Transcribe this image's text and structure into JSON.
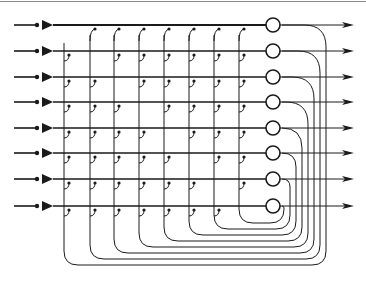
{
  "diagram": {
    "num_neurons": 8,
    "row_y": [
      25,
      51,
      77,
      102,
      128,
      153,
      179,
      206
    ],
    "column_x": [
      64,
      90,
      114,
      139,
      164,
      189,
      214,
      239
    ],
    "neuron_x": 273,
    "neuron_radius": 7,
    "input": {
      "line_start_x": 14,
      "dot_x": 37,
      "amp_left_x": 42,
      "amp_right_x": 53
    },
    "output": {
      "arrow_tip_x": 354
    },
    "feedback": {
      "bottom_y": [
        265,
        259,
        253,
        247,
        241,
        235,
        229,
        223
      ],
      "right_x": [
        326,
        320,
        314,
        308,
        302,
        296,
        290,
        284
      ]
    },
    "colors": {
      "stroke": "#1a1a1a",
      "border": "#8a8a8a",
      "background": "#ffffff"
    },
    "labels": {
      "inputs": [
        "input-1",
        "input-2",
        "input-3",
        "input-4",
        "input-5",
        "input-6",
        "input-7",
        "input-8"
      ],
      "outputs": [
        "output-1",
        "output-2",
        "output-3",
        "output-4",
        "output-5",
        "output-6",
        "output-7",
        "output-8"
      ]
    }
  }
}
